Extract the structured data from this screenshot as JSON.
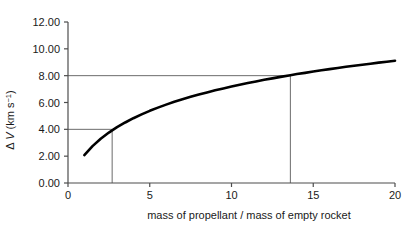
{
  "chart_data": {
    "type": "line",
    "title": "",
    "xlabel": "mass of propellant / mass of empty rocket",
    "ylabel_parts": {
      "delta": "Δ",
      "variable": "V",
      "units_open": "(km s",
      "units_exponent": "−1",
      "units_close": ")"
    },
    "ylabel": "Δ V (km s−1)",
    "xlim": [
      0,
      20
    ],
    "ylim": [
      0,
      12
    ],
    "xticks": [
      0,
      5,
      10,
      15,
      20
    ],
    "xtick_labels": [
      "0",
      "5",
      "10",
      "15",
      "20"
    ],
    "yticks": [
      0,
      2,
      4,
      6,
      8,
      10,
      12
    ],
    "ytick_labels": [
      "0.00",
      "2.00",
      "4.00",
      "6.00",
      "8.00",
      "10.00",
      "12.00"
    ],
    "grid": false,
    "legend": null,
    "series": [
      {
        "name": "delta-v curve",
        "color": "#000000",
        "x": [
          1.0,
          1.5,
          2.0,
          2.5,
          2.7,
          3.0,
          3.5,
          4.0,
          4.5,
          5.0,
          5.5,
          6.0,
          6.5,
          7.0,
          7.5,
          8.0,
          8.5,
          9.0,
          9.5,
          10.0,
          10.5,
          11.0,
          11.5,
          12.0,
          12.5,
          13.0,
          13.6,
          14.0,
          14.5,
          15.0,
          15.5,
          16.0,
          16.5,
          17.0,
          17.5,
          18.0,
          18.5,
          19.0,
          19.5,
          20.0
        ],
        "y": [
          2.08,
          2.75,
          3.3,
          3.76,
          3.92,
          4.16,
          4.51,
          4.83,
          5.11,
          5.38,
          5.62,
          5.84,
          6.05,
          6.24,
          6.42,
          6.59,
          6.75,
          6.91,
          7.05,
          7.19,
          7.32,
          7.45,
          7.57,
          7.69,
          7.8,
          7.91,
          8.03,
          8.12,
          8.21,
          8.31,
          8.4,
          8.49,
          8.57,
          8.66,
          8.74,
          8.82,
          8.89,
          8.97,
          9.04,
          9.11
        ]
      }
    ],
    "reference_lines": [
      {
        "name": "lower-reference",
        "y_value": 4.0,
        "x_value": 2.7,
        "color": "#6b6b6b"
      },
      {
        "name": "upper-reference",
        "y_value": 8.0,
        "x_value": 13.6,
        "color": "#6b6b6b"
      }
    ],
    "axis_color": "#4d4d4d",
    "curve_color": "#000000"
  }
}
